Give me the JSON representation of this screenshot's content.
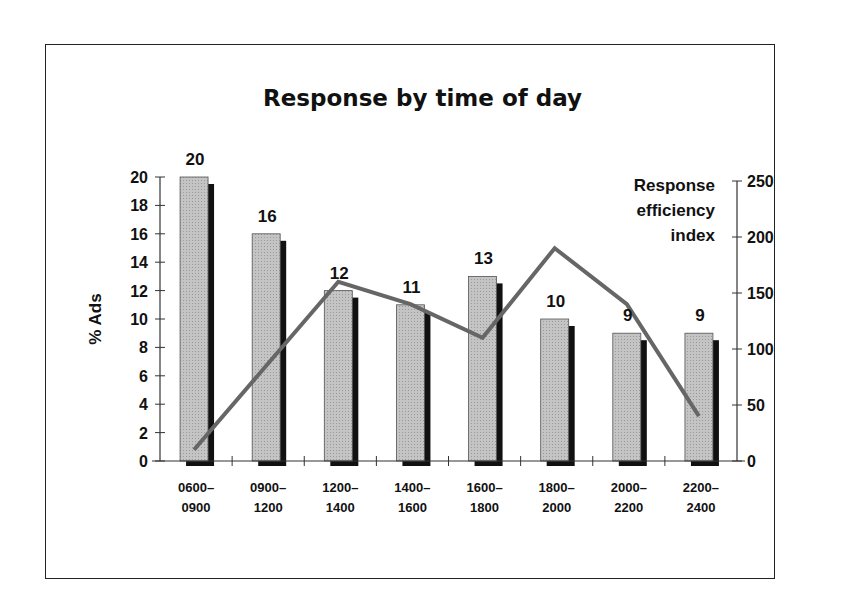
{
  "chart_data": {
    "type": "bar+line",
    "title": "Response by time of day",
    "categories": [
      "0600–0900",
      "0900–1200",
      "1200–1400",
      "1400–1600",
      "1600–1800",
      "1800–2000",
      "2000–2200",
      "2200–2400"
    ],
    "category_lines": [
      [
        "0600–",
        "0900"
      ],
      [
        "0900–",
        "1200"
      ],
      [
        "1200–",
        "1400"
      ],
      [
        "1400–",
        "1600"
      ],
      [
        "1600–",
        "1800"
      ],
      [
        "1800–",
        "2000"
      ],
      [
        "2000–",
        "2200"
      ],
      [
        "2200–",
        "2400"
      ]
    ],
    "series": [
      {
        "name": "% Ads",
        "type": "bar",
        "axis": "left",
        "values": [
          20,
          16,
          12,
          11,
          13,
          10,
          9,
          9
        ],
        "labels": [
          "20",
          "16",
          "12",
          "11",
          "13",
          "10",
          "9",
          "9"
        ],
        "color": "#b8b8b8"
      },
      {
        "name": "Response efficiency index",
        "type": "line",
        "axis": "right",
        "values": [
          10,
          85,
          160,
          140,
          110,
          190,
          140,
          40
        ],
        "color": "#666666"
      }
    ],
    "ylabel": "% Ads",
    "ylim": [
      0,
      20
    ],
    "yticks": [
      "0",
      "2",
      "4",
      "6",
      "8",
      "10",
      "12",
      "14",
      "16",
      "18",
      "20"
    ],
    "y2label": [
      "Response",
      "efficiency",
      "index"
    ],
    "y2lim": [
      0,
      250
    ],
    "y2ticks": [
      "0",
      "50",
      "100",
      "150",
      "200",
      "250"
    ],
    "grid": false,
    "legend": "none"
  }
}
